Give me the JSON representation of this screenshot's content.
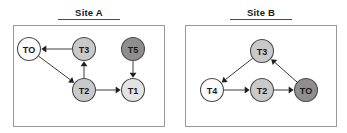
{
  "figure": {
    "background_color": "#ffffff",
    "edge_color": "#3a3a3a",
    "node_stroke_color": "#4d4d4d",
    "label_color": "#1a1a1a",
    "frame_color": "#9a9a9a"
  },
  "panels": [
    {
      "id": "site-a",
      "title": "Site A",
      "frame": {
        "x": 13,
        "y": 25,
        "width": 152,
        "height": 102
      },
      "nodes": [
        {
          "id": "A-TO",
          "label": "TO",
          "cx": 29,
          "cy": 49,
          "r": 11.5,
          "fill": "#fbfbfb"
        },
        {
          "id": "A-T3",
          "label": "T3",
          "cx": 84,
          "cy": 49,
          "r": 11.5,
          "fill": "#c9c9c9"
        },
        {
          "id": "A-T5",
          "label": "T5",
          "cx": 133,
          "cy": 49,
          "r": 11.5,
          "fill": "#8e8e8e"
        },
        {
          "id": "A-T2",
          "label": "T2",
          "cx": 84,
          "cy": 90,
          "r": 11.5,
          "fill": "#c9c9c9"
        },
        {
          "id": "A-T1",
          "label": "T1",
          "cx": 133,
          "cy": 90,
          "r": 11.5,
          "fill": "#e3e3e3"
        }
      ],
      "edges": [
        {
          "from": "A-T3",
          "to": "A-TO"
        },
        {
          "from": "A-TO",
          "to": "A-T2"
        },
        {
          "from": "A-T2",
          "to": "A-T3"
        },
        {
          "from": "A-T2",
          "to": "A-T1"
        },
        {
          "from": "A-T5",
          "to": "A-T1"
        }
      ]
    },
    {
      "id": "site-b",
      "title": "Site B",
      "frame": {
        "x": 185,
        "y": 25,
        "width": 152,
        "height": 102
      },
      "nodes": [
        {
          "id": "B-T3",
          "label": "T3",
          "cx": 262,
          "cy": 51,
          "r": 11.5,
          "fill": "#c9c9c9"
        },
        {
          "id": "B-T4",
          "label": "T4",
          "cx": 212,
          "cy": 90,
          "r": 11.5,
          "fill": "#fbfbfb"
        },
        {
          "id": "B-T2",
          "label": "T2",
          "cx": 262,
          "cy": 90,
          "r": 11.5,
          "fill": "#c9c9c9"
        },
        {
          "id": "B-TO",
          "label": "TO",
          "cx": 306,
          "cy": 90,
          "r": 11.5,
          "fill": "#8e8e8e"
        }
      ],
      "edges": [
        {
          "from": "B-T3",
          "to": "B-T4"
        },
        {
          "from": "B-T4",
          "to": "B-T2"
        },
        {
          "from": "B-T2",
          "to": "B-TO"
        },
        {
          "from": "B-TO",
          "to": "B-T3"
        }
      ]
    }
  ]
}
